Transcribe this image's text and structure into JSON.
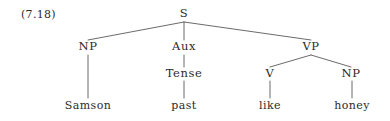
{
  "figure": {
    "example_number": "(7.18)",
    "caption": "",
    "background_color": "#ffffff",
    "ink_color": "#2b2b2b",
    "edge_color": "#6b6b6b"
  },
  "tree": {
    "type": "syntax-tree",
    "sentence": "Samson past like honey",
    "nodes": [
      {
        "id": "S",
        "label": "S",
        "x": 184,
        "y": 14,
        "kind": "nonterminal"
      },
      {
        "id": "NP1",
        "label": "NP",
        "x": 88,
        "y": 47,
        "kind": "nonterminal"
      },
      {
        "id": "AUX",
        "label": "Aux",
        "x": 184,
        "y": 47,
        "kind": "nonterminal"
      },
      {
        "id": "VP",
        "label": "VP",
        "x": 311,
        "y": 47,
        "kind": "nonterminal"
      },
      {
        "id": "TENSE",
        "label": "Tense",
        "x": 184,
        "y": 74,
        "kind": "nonterminal"
      },
      {
        "id": "V",
        "label": "V",
        "x": 270,
        "y": 74,
        "kind": "nonterminal"
      },
      {
        "id": "NP2",
        "label": "NP",
        "x": 351,
        "y": 74,
        "kind": "nonterminal"
      },
      {
        "id": "SAMSON",
        "label": "Samson",
        "x": 88,
        "y": 105,
        "kind": "terminal"
      },
      {
        "id": "PAST",
        "label": "past",
        "x": 184,
        "y": 105,
        "kind": "terminal"
      },
      {
        "id": "LIKE",
        "label": "like",
        "x": 270,
        "y": 105,
        "kind": "terminal"
      },
      {
        "id": "HONEY",
        "label": "honey",
        "x": 352,
        "y": 105,
        "kind": "terminal"
      }
    ],
    "edges": [
      {
        "from": "S",
        "to": "NP1",
        "x1": 184,
        "y1": 22,
        "x2": 88,
        "y2": 40
      },
      {
        "from": "S",
        "to": "AUX",
        "x1": 184,
        "y1": 22,
        "x2": 184,
        "y2": 40
      },
      {
        "from": "S",
        "to": "VP",
        "x1": 184,
        "y1": 22,
        "x2": 311,
        "y2": 40
      },
      {
        "from": "NP1",
        "to": "SAMSON",
        "x1": 88,
        "y1": 55,
        "x2": 88,
        "y2": 98
      },
      {
        "from": "AUX",
        "to": "TENSE",
        "x1": 184,
        "y1": 55,
        "x2": 184,
        "y2": 67
      },
      {
        "from": "TENSE",
        "to": "PAST",
        "x1": 184,
        "y1": 81,
        "x2": 184,
        "y2": 98
      },
      {
        "from": "VP",
        "to": "V",
        "x1": 311,
        "y1": 55,
        "x2": 270,
        "y2": 67
      },
      {
        "from": "VP",
        "to": "NP2",
        "x1": 311,
        "y1": 55,
        "x2": 351,
        "y2": 67
      },
      {
        "from": "V",
        "to": "LIKE",
        "x1": 270,
        "y1": 81,
        "x2": 270,
        "y2": 98
      },
      {
        "from": "NP2",
        "to": "HONEY",
        "x1": 352,
        "y1": 81,
        "x2": 352,
        "y2": 98
      }
    ]
  }
}
